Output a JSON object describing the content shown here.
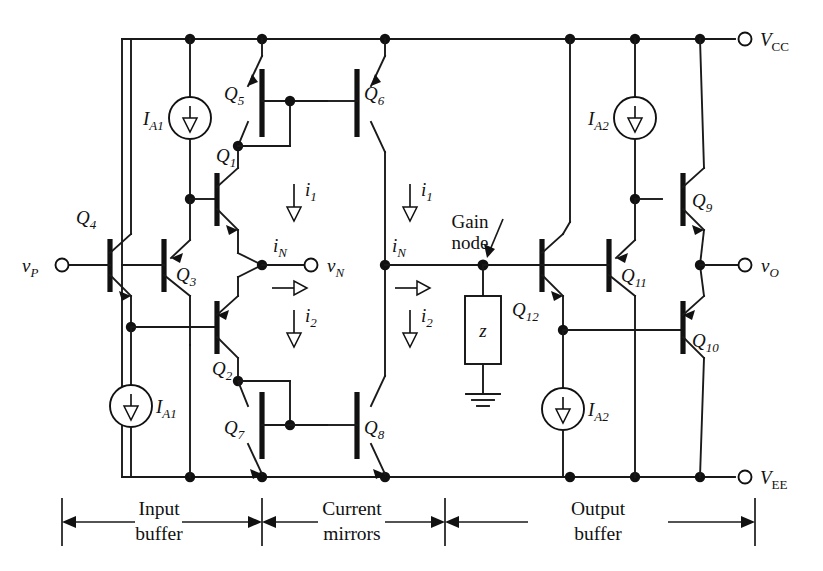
{
  "figure": {
    "kind": "circuit-schematic"
  },
  "rails": {
    "vcc": {
      "label": "V",
      "sub": "CC"
    },
    "vee": {
      "label": "V",
      "sub": "EE"
    }
  },
  "terminals": [
    {
      "id": "vp",
      "label": "v",
      "sub": "P"
    },
    {
      "id": "vn",
      "label": "v",
      "sub": "N"
    },
    {
      "id": "vo",
      "label": "v",
      "sub": "O"
    }
  ],
  "transistors": [
    {
      "id": "Q1",
      "label": "Q",
      "sub": "1",
      "type": "npn"
    },
    {
      "id": "Q2",
      "label": "Q",
      "sub": "2",
      "type": "pnp"
    },
    {
      "id": "Q3",
      "label": "Q",
      "sub": "3",
      "type": "pnp"
    },
    {
      "id": "Q4",
      "label": "Q",
      "sub": "4",
      "type": "npn"
    },
    {
      "id": "Q5",
      "label": "Q",
      "sub": "5",
      "type": "pnp"
    },
    {
      "id": "Q6",
      "label": "Q",
      "sub": "6",
      "type": "pnp"
    },
    {
      "id": "Q7",
      "label": "Q",
      "sub": "7",
      "type": "npn"
    },
    {
      "id": "Q8",
      "label": "Q",
      "sub": "8",
      "type": "npn"
    },
    {
      "id": "Q9",
      "label": "Q",
      "sub": "9",
      "type": "npn"
    },
    {
      "id": "Q10",
      "label": "Q",
      "sub": "10",
      "type": "pnp"
    },
    {
      "id": "Q11",
      "label": "Q",
      "sub": "11",
      "type": "pnp"
    },
    {
      "id": "Q12",
      "label": "Q",
      "sub": "12",
      "type": "npn"
    }
  ],
  "current_sources": [
    {
      "id": "ia1-top",
      "label": "I",
      "sub": "A1"
    },
    {
      "id": "ia1-bottom",
      "label": "I",
      "sub": "A1"
    },
    {
      "id": "ia2-top",
      "label": "I",
      "sub": "A2"
    },
    {
      "id": "ia2-bottom",
      "label": "I",
      "sub": "A2"
    }
  ],
  "currents": [
    {
      "id": "i1-left",
      "label": "i",
      "sub": "1",
      "direction": "down"
    },
    {
      "id": "i1-right",
      "label": "i",
      "sub": "1",
      "direction": "down"
    },
    {
      "id": "i2-left",
      "label": "i",
      "sub": "2",
      "direction": "down"
    },
    {
      "id": "i2-right",
      "label": "i",
      "sub": "2",
      "direction": "down"
    },
    {
      "id": "in-left",
      "label": "i",
      "sub": "N",
      "direction": "right"
    },
    {
      "id": "in-right",
      "label": "i",
      "sub": "N",
      "direction": "right"
    }
  ],
  "impedance": {
    "label": "z"
  },
  "annotations": {
    "gain_node_line1": "Gain",
    "gain_node_line2": "node"
  },
  "sections": [
    {
      "id": "input-buffer",
      "line1": "Input",
      "line2": "buffer"
    },
    {
      "id": "current-mirrors",
      "line1": "Current",
      "line2": "mirrors"
    },
    {
      "id": "output-buffer",
      "line1": "Output",
      "line2": "buffer"
    }
  ],
  "colors": {
    "ink": "#111111",
    "background": "#ffffff"
  }
}
